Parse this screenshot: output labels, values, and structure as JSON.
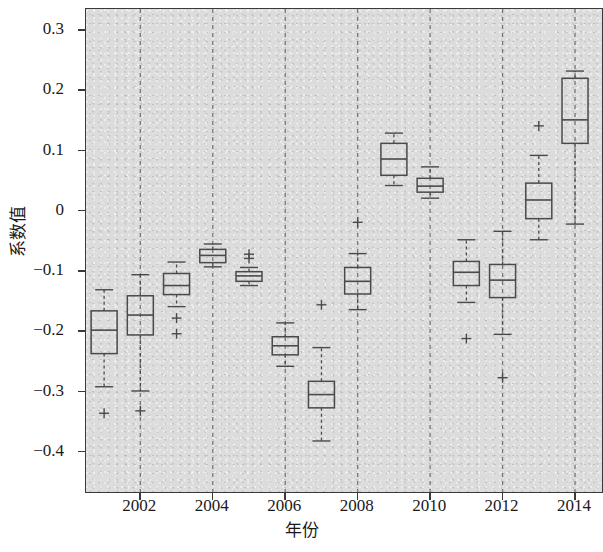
{
  "chart_data": {
    "type": "box",
    "title": "",
    "xlabel": "年份",
    "ylabel": "系数值",
    "xlim": [
      2000.5,
      2014.8
    ],
    "ylim": [
      -0.47,
      0.335
    ],
    "grid": "vertical dashed gridlines at even years",
    "legend": "none",
    "ytick_labels": [
      "0.3",
      "0.2",
      "0.1",
      "0",
      "−0.1",
      "−0.2",
      "−0.3",
      "−0.4"
    ],
    "ytick_values": [
      0.3,
      0.2,
      0.1,
      0,
      -0.1,
      -0.2,
      -0.3,
      -0.4
    ],
    "xtick_labels": [
      "2002",
      "2004",
      "2006",
      "2008",
      "2010",
      "2012",
      "2014"
    ],
    "xtick_values": [
      2002,
      2004,
      2006,
      2008,
      2010,
      2012,
      2014
    ],
    "categories": [
      2001,
      2002,
      2003,
      2004,
      2005,
      2006,
      2007,
      2008,
      2009,
      2010,
      2011,
      2012,
      2013,
      2014
    ],
    "boxes": [
      {
        "x": 2001,
        "whisker_low": -0.292,
        "q1": -0.237,
        "median": -0.198,
        "q3": -0.166,
        "whisker_high": -0.131,
        "outliers": [
          -0.336
        ]
      },
      {
        "x": 2002,
        "whisker_low": -0.299,
        "q1": -0.206,
        "median": -0.173,
        "q3": -0.141,
        "whisker_high": -0.106,
        "outliers": [
          -0.332
        ]
      },
      {
        "x": 2003,
        "whisker_low": -0.159,
        "q1": -0.139,
        "median": -0.124,
        "q3": -0.104,
        "whisker_high": -0.085,
        "outliers": [
          -0.178,
          -0.204
        ]
      },
      {
        "x": 2004,
        "whisker_low": -0.093,
        "q1": -0.086,
        "median": -0.074,
        "q3": -0.064,
        "whisker_high": -0.055,
        "outliers": []
      },
      {
        "x": 2005,
        "whisker_low": -0.124,
        "q1": -0.117,
        "median": -0.108,
        "q3": -0.101,
        "whisker_high": -0.094,
        "outliers": [
          -0.072,
          -0.079
        ]
      },
      {
        "x": 2006,
        "whisker_low": -0.258,
        "q1": -0.239,
        "median": -0.224,
        "q3": -0.209,
        "whisker_high": -0.186,
        "outliers": []
      },
      {
        "x": 2007,
        "whisker_low": -0.382,
        "q1": -0.327,
        "median": -0.305,
        "q3": -0.283,
        "whisker_high": -0.227,
        "outliers": [
          -0.156
        ]
      },
      {
        "x": 2008,
        "whisker_low": -0.164,
        "q1": -0.138,
        "median": -0.117,
        "q3": -0.094,
        "whisker_high": -0.071,
        "outliers": [
          -0.019
        ]
      },
      {
        "x": 2009,
        "whisker_low": 0.042,
        "q1": 0.059,
        "median": 0.086,
        "q3": 0.112,
        "whisker_high": 0.129,
        "outliers": []
      },
      {
        "x": 2010,
        "whisker_low": 0.021,
        "q1": 0.031,
        "median": 0.041,
        "q3": 0.054,
        "whisker_high": 0.073,
        "outliers": []
      },
      {
        "x": 2011,
        "whisker_low": -0.152,
        "q1": -0.124,
        "median": -0.102,
        "q3": -0.084,
        "whisker_high": -0.048,
        "outliers": [
          -0.212
        ]
      },
      {
        "x": 2012,
        "whisker_low": -0.205,
        "q1": -0.144,
        "median": -0.115,
        "q3": -0.089,
        "whisker_high": -0.034,
        "outliers": [
          -0.277
        ]
      },
      {
        "x": 2013,
        "whisker_low": -0.048,
        "q1": -0.013,
        "median": 0.018,
        "q3": 0.046,
        "whisker_high": 0.092,
        "outliers": [
          0.141
        ]
      },
      {
        "x": 2014,
        "whisker_low": -0.022,
        "q1": 0.112,
        "median": 0.151,
        "q3": 0.22,
        "whisker_high": 0.232,
        "outliers": []
      }
    ],
    "style": {
      "plot_background": "#dcdcdc",
      "box_line_color": "#4a4a4a",
      "whisker_style": "dashed",
      "outlier_marker": "+",
      "gridline_color": "#666666",
      "gridline_style": "dashed",
      "axis_color": "#3a3a3a"
    }
  }
}
